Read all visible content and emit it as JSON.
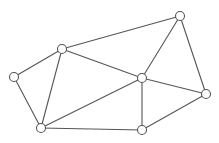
{
  "diagram": {
    "type": "undirected-graph",
    "colors": {
      "edge": "#555555",
      "node_fill": "#ffffff",
      "node_stroke": "#555555",
      "background": "#ffffff"
    },
    "node_radius": 4.5,
    "nodes": [
      {
        "id": "A",
        "x": 14,
        "y": 77
      },
      {
        "id": "B",
        "x": 62,
        "y": 49
      },
      {
        "id": "C",
        "x": 180,
        "y": 16
      },
      {
        "id": "D",
        "x": 142,
        "y": 78
      },
      {
        "id": "E",
        "x": 206,
        "y": 94
      },
      {
        "id": "F",
        "x": 142,
        "y": 130
      },
      {
        "id": "G",
        "x": 41,
        "y": 128
      }
    ],
    "edges": [
      [
        "A",
        "B"
      ],
      [
        "A",
        "G"
      ],
      [
        "B",
        "G"
      ],
      [
        "B",
        "C"
      ],
      [
        "B",
        "D"
      ],
      [
        "C",
        "D"
      ],
      [
        "C",
        "E"
      ],
      [
        "D",
        "E"
      ],
      [
        "D",
        "G"
      ],
      [
        "D",
        "F"
      ],
      [
        "G",
        "F"
      ],
      [
        "F",
        "E"
      ]
    ]
  }
}
